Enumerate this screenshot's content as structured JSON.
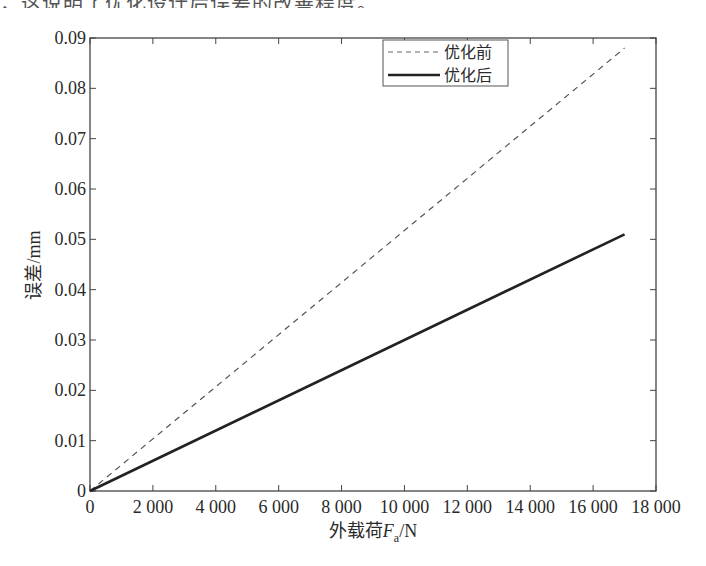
{
  "caption_fragment": "，这说明了优化设计后误差的改善程度。",
  "chart_data": {
    "type": "line",
    "title": "",
    "xlabel": "外载荷Fa/N",
    "xlabel_parts": {
      "prefix": "外载荷",
      "var": "F",
      "sub": "a",
      "suffix": "/N"
    },
    "ylabel": "误差/mm",
    "xlim": [
      0,
      18000
    ],
    "ylim": [
      0,
      0.09
    ],
    "xticks": [
      0,
      2000,
      4000,
      6000,
      8000,
      10000,
      12000,
      14000,
      16000,
      18000
    ],
    "xtick_labels": [
      "0",
      "2 000",
      "4 000",
      "6 000",
      "8 000",
      "10 000",
      "12 000",
      "14 000",
      "16 000",
      "18 000"
    ],
    "yticks": [
      0,
      0.01,
      0.02,
      0.03,
      0.04,
      0.05,
      0.06,
      0.07,
      0.08,
      0.09
    ],
    "ytick_labels": [
      "0",
      "0.01",
      "0.02",
      "0.03",
      "0.04",
      "0.05",
      "0.06",
      "0.07",
      "0.08",
      "0.09"
    ],
    "grid": false,
    "legend_position": "upper center",
    "series": [
      {
        "name": "优化前",
        "style": "dashed",
        "color": "#555555",
        "x": [
          0,
          17000
        ],
        "y": [
          0,
          0.088
        ]
      },
      {
        "name": "优化后",
        "style": "solid",
        "color": "#222222",
        "x": [
          0,
          17000
        ],
        "y": [
          0,
          0.051
        ]
      }
    ]
  }
}
